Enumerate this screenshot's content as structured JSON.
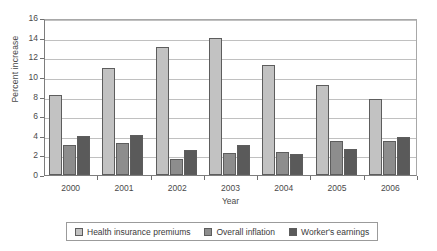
{
  "chart_data": {
    "type": "bar",
    "title": "",
    "xlabel": "Year",
    "ylabel": "Percent increase",
    "categories": [
      "2000",
      "2001",
      "2002",
      "2003",
      "2004",
      "2005",
      "2006"
    ],
    "ylim": [
      0,
      16
    ],
    "yticks": [
      0,
      2,
      4,
      6,
      8,
      10,
      12,
      14,
      16
    ],
    "ytick_labels": [
      "0",
      "2",
      "4",
      "6",
      "8",
      "10",
      "12",
      "14",
      "16"
    ],
    "grid": true,
    "legend_position": "bottom",
    "series": [
      {
        "name": "Health insurance premiums",
        "color": "#c2c2c2",
        "values": [
          8.2,
          10.9,
          13.0,
          14.0,
          11.2,
          9.2,
          7.7
        ]
      },
      {
        "name": "Overall inflation",
        "color": "#8d8d8d",
        "values": [
          3.1,
          3.3,
          1.6,
          2.2,
          2.3,
          3.5,
          3.5
        ]
      },
      {
        "name": "Worker's earnings",
        "color": "#5a5a5a",
        "values": [
          4.0,
          4.1,
          2.6,
          3.1,
          2.1,
          2.7,
          3.9
        ]
      }
    ]
  },
  "colors": {
    "series_1": "#c2c2c2",
    "series_2": "#8d8d8d",
    "series_3": "#5a5a5a",
    "grid": "#c0c0c0",
    "axis": "#7d7d7d",
    "text": "#3a3a3a",
    "background": "#ffffff"
  }
}
